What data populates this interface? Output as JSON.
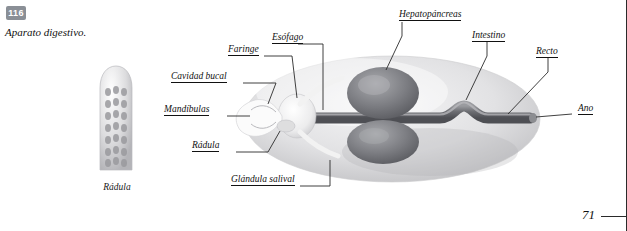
{
  "page": {
    "figure_number": "116",
    "figure_caption": "Aparato digestivo.",
    "page_number": "71"
  },
  "inset": {
    "caption": "Rádula"
  },
  "labels": [
    {
      "id": "esofago",
      "text": "Esófago"
    },
    {
      "id": "hepatopancreas",
      "text": "Hepatopáncreas"
    },
    {
      "id": "intestino",
      "text": "Intestino"
    },
    {
      "id": "recto",
      "text": "Recto"
    },
    {
      "id": "ano",
      "text": "Ano"
    },
    {
      "id": "faringe",
      "text": "Faringe"
    },
    {
      "id": "cavidad-bucal",
      "text": "Cavidad bucal"
    },
    {
      "id": "mandibulas",
      "text": "Mandíbulas"
    },
    {
      "id": "radula",
      "text": "Rádula"
    },
    {
      "id": "glandula-salival",
      "text": "Glándula salival"
    }
  ],
  "colors": {
    "badge": "#8a8f96",
    "ink": "#1a1a1a",
    "body_light": "#e9e9ea",
    "body_mid": "#c9c9cb",
    "organ_dark": "#6f7074"
  }
}
